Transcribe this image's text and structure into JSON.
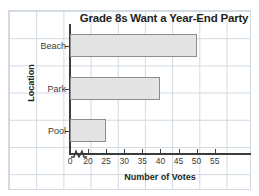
{
  "chart_data": {
    "type": "bar",
    "orientation": "horizontal",
    "title": "Grade 8s Want a Year-End Party",
    "xlabel": "Number of Votes",
    "ylabel": "Location",
    "categories": [
      "Beach",
      "Park",
      "Pool"
    ],
    "values": [
      50,
      40,
      25
    ],
    "xlim": [
      0,
      58
    ],
    "xticks": [
      0,
      20,
      25,
      30,
      35,
      40,
      45,
      50,
      55
    ],
    "xtick_labels": [
      "0",
      "20",
      "25",
      "30",
      "35",
      "40",
      "45",
      "50",
      "55"
    ],
    "axis_break": true,
    "axis_break_between": [
      0,
      20
    ],
    "grid": true,
    "legend": "none",
    "bar_fill_color": "#e4e4e4",
    "bar_border_color": "#8d8d8d",
    "axis_color": "#3b3b3b",
    "grid_color": "#c9d4dd",
    "text_color": "#231f20",
    "background_color": "#ffffff"
  }
}
